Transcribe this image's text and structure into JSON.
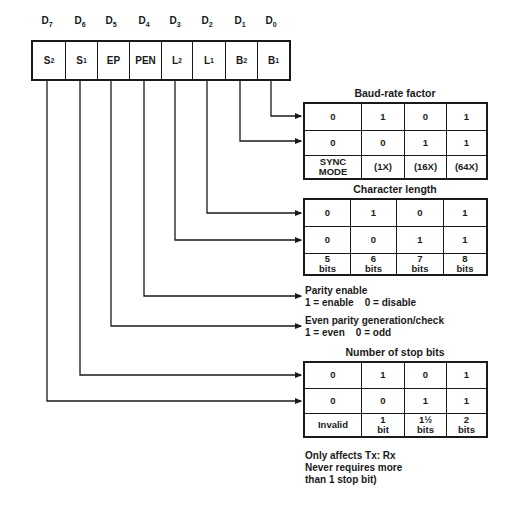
{
  "register": {
    "bit_labels": [
      {
        "main": "D",
        "sub": "7"
      },
      {
        "main": "D",
        "sub": "6"
      },
      {
        "main": "D",
        "sub": "5"
      },
      {
        "main": "D",
        "sub": "4"
      },
      {
        "main": "D",
        "sub": "3"
      },
      {
        "main": "D",
        "sub": "2"
      },
      {
        "main": "D",
        "sub": "1"
      },
      {
        "main": "D",
        "sub": "0"
      }
    ],
    "fields": [
      {
        "main": "S",
        "sub": "2"
      },
      {
        "main": "S",
        "sub": "1"
      },
      {
        "main": "EP",
        "sub": ""
      },
      {
        "main": "PEN",
        "sub": ""
      },
      {
        "main": "L",
        "sub": "2"
      },
      {
        "main": "L",
        "sub": "1"
      },
      {
        "main": "B",
        "sub": "2"
      },
      {
        "main": "B",
        "sub": "1"
      }
    ]
  },
  "baud_rate": {
    "title": "Baud-rate factor",
    "row1": [
      "0",
      "1",
      "0",
      "1"
    ],
    "row2": [
      "0",
      "0",
      "1",
      "1"
    ],
    "row3": [
      "SYNC\nMODE",
      "(1X)",
      "(16X)",
      "(64X)"
    ]
  },
  "char_length": {
    "title": "Character length",
    "row1": [
      "0",
      "1",
      "0",
      "1"
    ],
    "row2": [
      "0",
      "0",
      "1",
      "1"
    ],
    "row3": [
      "5\nbits",
      "6\nbits",
      "7\nbits",
      "8\nbits"
    ]
  },
  "parity_enable": {
    "title": "Parity enable",
    "desc": "1 = enable    0 = disable"
  },
  "even_parity": {
    "title": "Even parity generation/check",
    "desc": "1 = even    0 = odd"
  },
  "stop_bits": {
    "title": "Number of stop bits",
    "row1": [
      "0",
      "1",
      "0",
      "1"
    ],
    "row2": [
      "0",
      "0",
      "1",
      "1"
    ],
    "row3": [
      "Invalid",
      "1\nbit",
      "1½\nbits",
      "2\nbits"
    ]
  },
  "footnote": {
    "line1": "Only affects Tx: Rx",
    "line2": "Never requires more",
    "line3": "than 1 stop bit)"
  }
}
